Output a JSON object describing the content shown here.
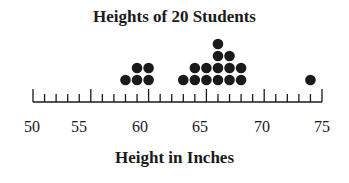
{
  "chart_data": {
    "type": "scatter",
    "subtype": "dot_plot",
    "title": "Heights of 20 Students",
    "xlabel": "Height in Inches",
    "ylabel": "",
    "xlim": [
      50,
      75
    ],
    "x_ticks_major": [
      50,
      55,
      60,
      65,
      70,
      75
    ],
    "x_tick_labels": [
      "50",
      "55",
      "60",
      "65",
      "70",
      "75"
    ],
    "x_tick_minor_step": 1,
    "grid": false,
    "legend": null,
    "points": [
      {
        "x": 58,
        "count": 1
      },
      {
        "x": 59,
        "count": 2
      },
      {
        "x": 60,
        "count": 2
      },
      {
        "x": 63,
        "count": 1
      },
      {
        "x": 64,
        "count": 2
      },
      {
        "x": 65,
        "count": 2
      },
      {
        "x": 66,
        "count": 4
      },
      {
        "x": 67,
        "count": 3
      },
      {
        "x": 68,
        "count": 2
      },
      {
        "x": 74,
        "count": 1
      }
    ],
    "total": 20,
    "dot_color": "#1a1a1a"
  }
}
